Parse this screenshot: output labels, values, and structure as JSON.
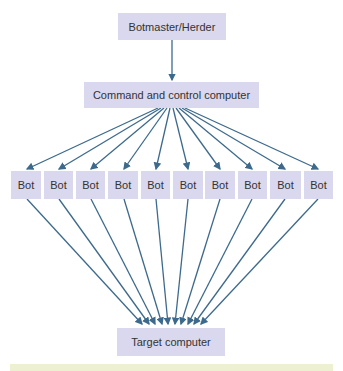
{
  "diagram": {
    "top_node": {
      "label": "Botmaster/Herder"
    },
    "cc_node": {
      "label": "Command and control computer"
    },
    "bots": [
      {
        "label": "Bot"
      },
      {
        "label": "Bot"
      },
      {
        "label": "Bot"
      },
      {
        "label": "Bot"
      },
      {
        "label": "Bot"
      },
      {
        "label": "Bot"
      },
      {
        "label": "Bot"
      },
      {
        "label": "Bot"
      },
      {
        "label": "Bot"
      },
      {
        "label": "Bot"
      }
    ],
    "target_node": {
      "label": "Target computer"
    },
    "colors": {
      "node_fill": "#d9d8ef",
      "arrow": "#3d6a8c",
      "footer_band": "#eef0d2"
    }
  }
}
